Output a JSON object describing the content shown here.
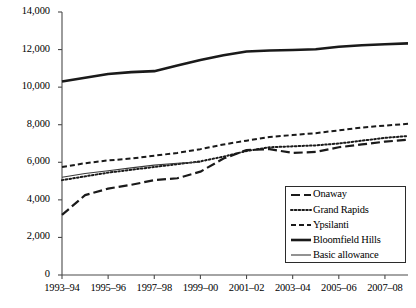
{
  "chart_data": {
    "type": "line",
    "title": "",
    "xlabel": "",
    "ylabel": "",
    "ylim": [
      0,
      14000
    ],
    "ytick_values": [
      0,
      2000,
      4000,
      6000,
      8000,
      10000,
      12000,
      14000
    ],
    "ytick_labels": [
      "0",
      "2,000",
      "4,000",
      "6,000",
      "8,000",
      "10,000",
      "12,000",
      "14,000"
    ],
    "grid": false,
    "legend_position": "lower-right",
    "x": [
      "1993-94",
      "1994-95",
      "1995-96",
      "1996-97",
      "1997-98",
      "1998-99",
      "1999-00",
      "2000-01",
      "2001-02",
      "2002-03",
      "2003-04",
      "2004-05",
      "2005-06",
      "2006-07",
      "2007-08",
      "2008-09"
    ],
    "xtick_labels": [
      "1993–94",
      "1995–96",
      "1997–98",
      "1999–00",
      "2001–02",
      "2003–04",
      "2005–06",
      "2007–08"
    ],
    "series": [
      {
        "name": "Onaway",
        "style": "long-dash",
        "color": "#1a1a1a",
        "width": 2.2,
        "values": [
          3200,
          4250,
          4600,
          4800,
          5050,
          5150,
          5500,
          6200,
          6650,
          6700,
          6500,
          6550,
          6800,
          6950,
          7100,
          7200
        ]
      },
      {
        "name": "Grand Rapids",
        "style": "dotted",
        "color": "#1a1a1a",
        "width": 2.0,
        "values": [
          5050,
          5250,
          5450,
          5600,
          5750,
          5900,
          6050,
          6300,
          6600,
          6800,
          6850,
          6900,
          7000,
          7150,
          7300,
          7400
        ]
      },
      {
        "name": "Ypsilanti",
        "style": "short-dash",
        "color": "#1a1a1a",
        "width": 2.0,
        "values": [
          5750,
          5950,
          6100,
          6200,
          6350,
          6500,
          6700,
          6950,
          7150,
          7350,
          7450,
          7550,
          7700,
          7850,
          7950,
          8050
        ]
      },
      {
        "name": "Bloomfield Hills",
        "style": "solid-thick",
        "color": "#1a1a1a",
        "width": 2.6,
        "values": [
          10300,
          10500,
          10700,
          10800,
          10850,
          11150,
          11450,
          11700,
          11900,
          11950,
          11980,
          12020,
          12150,
          12230,
          12280,
          12330
        ]
      },
      {
        "name": "Basic allowance",
        "style": "solid-thin",
        "color": "#3a3a3a",
        "width": 1.1,
        "values": [
          5200,
          5400,
          5550,
          5700,
          5850,
          5950,
          6000,
          null,
          null,
          null,
          null,
          null,
          null,
          null,
          null,
          null
        ]
      }
    ]
  },
  "legend": {
    "entries": [
      {
        "label": "Onaway"
      },
      {
        "label": "Grand Rapids"
      },
      {
        "label": "Ypsilanti"
      },
      {
        "label": "Bloomfield Hills"
      },
      {
        "label": "Basic allowance"
      }
    ]
  },
  "axis": {
    "x_min_index": 0,
    "x_max_index": 15
  }
}
